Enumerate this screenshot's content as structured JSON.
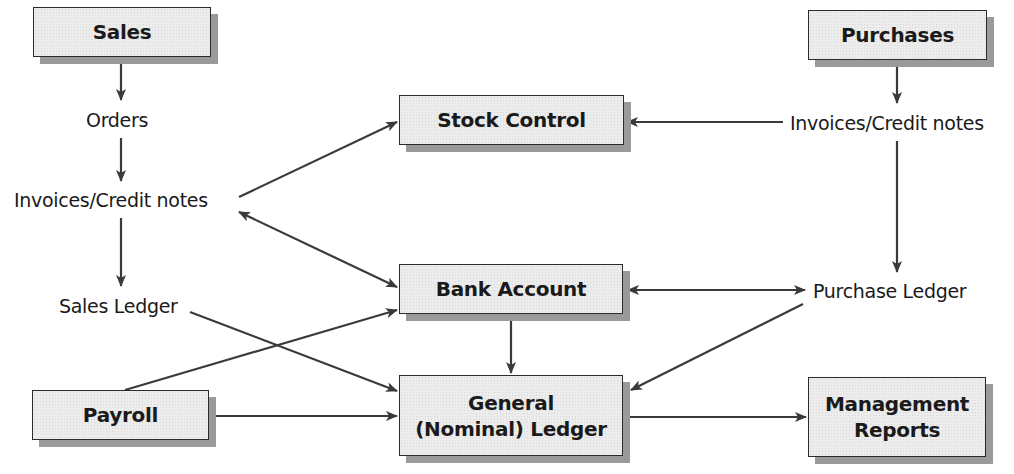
{
  "diagram": {
    "boxes": {
      "sales": "Sales",
      "purchases": "Purchases",
      "stock_control": "Stock Control",
      "bank_account": "Bank Account",
      "general_ledger_line1": "General",
      "general_ledger_line2": "(Nominal) Ledger",
      "payroll": "Payroll",
      "management_reports_line1": "Management",
      "management_reports_line2": "Reports"
    },
    "labels": {
      "orders": "Orders",
      "sales_invoices": "Invoices/Credit notes",
      "sales_ledger": "Sales Ledger",
      "purchase_invoices": "Invoices/Credit notes",
      "purchase_ledger": "Purchase Ledger"
    },
    "edges": [
      {
        "from": "Sales",
        "to": "Orders"
      },
      {
        "from": "Orders",
        "to": "Invoices/Credit notes (sales)"
      },
      {
        "from": "Invoices/Credit notes (sales)",
        "to": "Stock Control"
      },
      {
        "from": "Invoices/Credit notes (sales)",
        "to": "Bank Account",
        "bidirectional": true
      },
      {
        "from": "Invoices/Credit notes (sales)",
        "to": "Sales Ledger"
      },
      {
        "from": "Sales Ledger",
        "to": "General (Nominal) Ledger"
      },
      {
        "from": "Payroll",
        "to": "Bank Account"
      },
      {
        "from": "Payroll",
        "to": "General (Nominal) Ledger"
      },
      {
        "from": "Purchases",
        "to": "Invoices/Credit notes (purchases)"
      },
      {
        "from": "Invoices/Credit notes (purchases)",
        "to": "Stock Control"
      },
      {
        "from": "Invoices/Credit notes (purchases)",
        "to": "Purchase Ledger"
      },
      {
        "from": "Bank Account",
        "to": "Purchase Ledger",
        "bidirectional": true
      },
      {
        "from": "Bank Account",
        "to": "General (Nominal) Ledger"
      },
      {
        "from": "Purchase Ledger",
        "to": "General (Nominal) Ledger"
      },
      {
        "from": "General (Nominal) Ledger",
        "to": "Management Reports"
      }
    ],
    "colors": {
      "line": "#3a3a3a",
      "box_fill": "#ececec",
      "box_shadow": "#9a9a9a"
    }
  }
}
